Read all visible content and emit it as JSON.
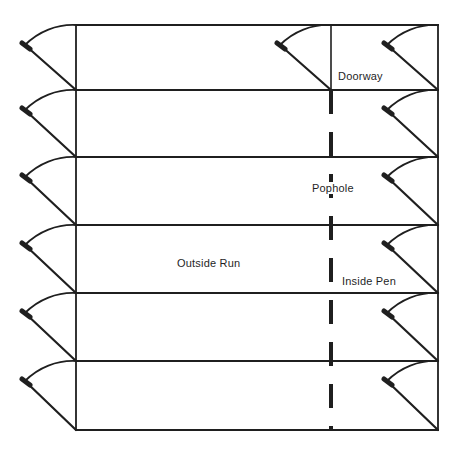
{
  "figure": {
    "type": "pen-housing-line-diagram",
    "pen_rows": 6,
    "labels": {
      "doorway": "Doorway",
      "pophole": "Pophole",
      "outside_run": "Outside Run",
      "inside_pen": "Inside Pen"
    },
    "colors": {
      "line": "#1f1f1f",
      "text": "#1f1f1f",
      "background": "#ffffff"
    }
  }
}
